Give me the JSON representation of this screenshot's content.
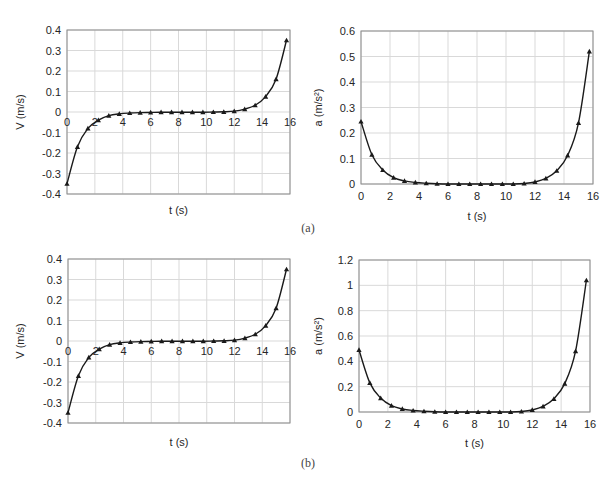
{
  "captions": {
    "a": "(a)",
    "b": "(b)"
  },
  "style": {
    "line_color": "#1a1a1a",
    "grid_color": "#d9d9d9",
    "frame_color": "#8c8c8c",
    "text_color": "#262626"
  },
  "chart_data": [
    {
      "id": "a-velocity",
      "panel": "(a)",
      "type": "line",
      "title": "",
      "xlabel": "t (s)",
      "ylabel": "V (m/s)",
      "xlim": [
        0,
        16
      ],
      "ylim": [
        -0.4,
        0.4
      ],
      "xticks": [
        0,
        2,
        4,
        6,
        8,
        10,
        12,
        14,
        16
      ],
      "yticks": [
        -0.4,
        -0.3,
        -0.2,
        -0.1,
        0,
        0.1,
        0.2,
        0.3,
        0.4
      ],
      "ytick_labels": [
        "-0.4",
        "-0.3",
        "-0.2",
        "-0.1",
        "0",
        "0.1",
        "0.2",
        "0.3",
        "0.4"
      ],
      "xtick_position": "at-zero-line",
      "grid": true,
      "marker": "triangle",
      "x": [
        0,
        0.75,
        1.5,
        2.25,
        3,
        3.75,
        4.5,
        5.25,
        6,
        6.75,
        7.5,
        8.25,
        9,
        9.75,
        10.5,
        11.25,
        12,
        12.75,
        13.5,
        14.25,
        15,
        15.75
      ],
      "values": [
        -0.35,
        -0.17,
        -0.08,
        -0.04,
        -0.018,
        -0.009,
        -0.005,
        -0.003,
        -0.002,
        -0.001,
        -0.001,
        -0.001,
        -0.001,
        -0.001,
        0.0,
        0.001,
        0.004,
        0.014,
        0.033,
        0.075,
        0.16,
        0.35
      ],
      "box": {
        "left": 67,
        "top": 30,
        "right": 290,
        "bottom": 194
      },
      "label_pos": {
        "xlabel_y": 214,
        "ylabel_x": 24
      }
    },
    {
      "id": "a-acceleration",
      "panel": "(a)",
      "type": "line",
      "title": "",
      "xlabel": "t (s)",
      "ylabel": "a (m/s²)",
      "xlim": [
        0,
        16
      ],
      "ylim": [
        0,
        0.6
      ],
      "xticks": [
        0,
        2,
        4,
        6,
        8,
        10,
        12,
        14,
        16
      ],
      "yticks": [
        0,
        0.1,
        0.2,
        0.3,
        0.4,
        0.5,
        0.6
      ],
      "ytick_labels": [
        "0",
        "0.1",
        "0.2",
        "0.3",
        "0.4",
        "0.5",
        "0.6"
      ],
      "xtick_position": "below",
      "grid": true,
      "marker": "triangle",
      "x": [
        0,
        0.75,
        1.5,
        2.25,
        3,
        3.75,
        4.5,
        5.25,
        6,
        6.75,
        7.5,
        8.25,
        9,
        9.75,
        10.5,
        11.25,
        12,
        12.75,
        13.5,
        14.25,
        15,
        15.75
      ],
      "values": [
        0.245,
        0.115,
        0.055,
        0.025,
        0.012,
        0.006,
        0.003,
        0.001,
        0.0,
        0.0,
        0.0,
        0.0,
        0.0,
        0.0,
        0.0,
        0.002,
        0.008,
        0.022,
        0.052,
        0.112,
        0.24,
        0.52
      ],
      "box": {
        "left": 361,
        "top": 31,
        "right": 593,
        "bottom": 184
      },
      "label_pos": {
        "xlabel_y": 220,
        "ylabel_x": 322
      }
    },
    {
      "id": "b-velocity",
      "panel": "(b)",
      "type": "line",
      "title": "",
      "xlabel": "t (s)",
      "ylabel": "V (m/s)",
      "xlim": [
        0,
        16
      ],
      "ylim": [
        -0.4,
        0.4
      ],
      "xticks": [
        0,
        2,
        4,
        6,
        8,
        10,
        12,
        14,
        16
      ],
      "yticks": [
        -0.4,
        -0.3,
        -0.2,
        -0.1,
        0,
        0.1,
        0.2,
        0.3,
        0.4
      ],
      "ytick_labels": [
        "-0.4",
        "-0.3",
        "-0.2",
        "-0.1",
        "0",
        "0.1",
        "0.2",
        "0.3",
        "0.4"
      ],
      "xtick_position": "at-zero-line",
      "grid": true,
      "marker": "triangle",
      "x": [
        0,
        0.75,
        1.5,
        2.25,
        3,
        3.75,
        4.5,
        5.25,
        6,
        6.75,
        7.5,
        8.25,
        9,
        9.75,
        10.5,
        11.25,
        12,
        12.75,
        13.5,
        14.25,
        15,
        15.75
      ],
      "values": [
        -0.35,
        -0.17,
        -0.08,
        -0.04,
        -0.018,
        -0.009,
        -0.005,
        -0.003,
        -0.002,
        -0.001,
        -0.001,
        -0.001,
        -0.001,
        -0.001,
        0.0,
        0.001,
        0.004,
        0.014,
        0.033,
        0.075,
        0.16,
        0.35
      ],
      "box": {
        "left": 68,
        "top": 259,
        "right": 290,
        "bottom": 423
      },
      "label_pos": {
        "xlabel_y": 446,
        "ylabel_x": 24
      }
    },
    {
      "id": "b-acceleration",
      "panel": "(b)",
      "type": "line",
      "title": "",
      "xlabel": "t (s)",
      "ylabel": "a (m/s²)",
      "xlim": [
        0,
        16
      ],
      "ylim": [
        0,
        1.2
      ],
      "xticks": [
        0,
        2,
        4,
        6,
        8,
        10,
        12,
        14,
        16
      ],
      "yticks": [
        0,
        0.2,
        0.4,
        0.6,
        0.8,
        1.0,
        1.2
      ],
      "ytick_labels": [
        "0",
        "0.2",
        "0.4",
        "0.6",
        "0.8",
        "1",
        "1.2"
      ],
      "xtick_position": "below",
      "grid": true,
      "marker": "triangle",
      "x": [
        0,
        0.75,
        1.5,
        2.25,
        3,
        3.75,
        4.5,
        5.25,
        6,
        6.75,
        7.5,
        8.25,
        9,
        9.75,
        10.5,
        11.25,
        12,
        12.75,
        13.5,
        14.25,
        15,
        15.75
      ],
      "values": [
        0.49,
        0.23,
        0.11,
        0.05,
        0.024,
        0.012,
        0.006,
        0.002,
        0.0,
        0.0,
        0.0,
        0.0,
        0.0,
        0.0,
        0.0,
        0.004,
        0.016,
        0.044,
        0.104,
        0.224,
        0.48,
        1.04
      ],
      "box": {
        "left": 359,
        "top": 260,
        "right": 590,
        "bottom": 412
      },
      "label_pos": {
        "xlabel_y": 447,
        "ylabel_x": 322
      }
    }
  ]
}
